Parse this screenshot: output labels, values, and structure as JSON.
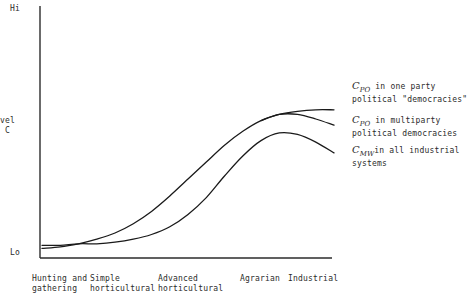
{
  "chart_data": {
    "type": "line",
    "title": "",
    "xlabel": "",
    "ylabel": "Level of C",
    "y_axis": {
      "top_tick": "Hi",
      "bottom_tick": "Lo",
      "label_line1": "evel",
      "label_line2": "f C",
      "full_label": "Level of C"
    },
    "categories": [
      "Hunting and\ngathering",
      "Simple\nhorticultural",
      "Advanced\nhorticultural",
      "Agrarian",
      "Industrial"
    ],
    "grid": false,
    "legend_position": "right-inline-annotations",
    "series": [
      {
        "name": "C_PO in one party political \"democracies\"",
        "symbol": "C",
        "subscript": "PO",
        "annotation_line1": "in one party",
        "annotation_line2": "political \"democracies\"",
        "color": "#1a1a1a",
        "x": [
          0,
          0.25,
          0.5,
          0.75,
          1.0,
          1.25,
          1.5,
          1.75,
          2.0,
          2.25,
          2.5,
          2.75,
          3.0,
          3.25,
          3.5,
          3.75,
          4.0
        ],
        "values": [
          3,
          4,
          6,
          9,
          13,
          19,
          27,
          37,
          48,
          59,
          70,
          79,
          86,
          90,
          92,
          93,
          93
        ]
      },
      {
        "name": "C_PO in multiparty political democracies",
        "symbol": "C",
        "subscript": "PO",
        "annotation_line1": "in multiparty",
        "annotation_line2": "political democracies",
        "color": "#1a1a1a",
        "x": [
          3.0,
          3.25,
          3.5,
          3.75,
          4.0
        ],
        "values": [
          86,
          90,
          90,
          87,
          83
        ]
      },
      {
        "name": "C_MW in all industrial systems",
        "symbol": "C",
        "subscript": "MW",
        "annotation_line1": "in all industrial",
        "annotation_line2": "systems",
        "color": "#1a1a1a",
        "x": [
          0,
          0.25,
          0.5,
          0.75,
          1.0,
          1.25,
          1.5,
          1.75,
          2.0,
          2.25,
          2.5,
          2.75,
          3.0,
          3.25,
          3.5,
          3.75,
          4.0
        ],
        "values": [
          5,
          5,
          6,
          6,
          7,
          9,
          12,
          17,
          25,
          36,
          50,
          63,
          73,
          78,
          77,
          72,
          65
        ]
      }
    ]
  },
  "axes": {
    "y_top": "Hi",
    "y_bottom": "Lo",
    "y_title_line1": "evel",
    "y_title_line2": "f C"
  },
  "x_labels": [
    {
      "line1": "Hunting and",
      "line2": "gathering"
    },
    {
      "line1": "Simple",
      "line2": "horticultural"
    },
    {
      "line1": "Advanced",
      "line2": "horticultural"
    },
    {
      "line1": "Agrarian",
      "line2": ""
    },
    {
      "line1": "Industrial",
      "line2": ""
    }
  ],
  "annotations": [
    {
      "symbol": "C",
      "sub": "PO",
      "line1": " in one party",
      "line2": "political \"democracies\""
    },
    {
      "symbol": "C",
      "sub": "PO",
      "line1": " in multiparty",
      "line2": "political democracies"
    },
    {
      "symbol": "C",
      "sub": "MW",
      "line1": "in all industrial",
      "line2": "systems"
    }
  ],
  "colors": {
    "ink": "#1a1a1a",
    "axis": "#2b2b2b",
    "background": "#ffffff"
  }
}
